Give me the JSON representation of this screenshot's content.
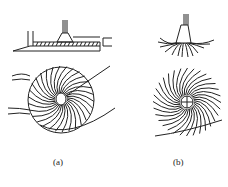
{
  "figure": {
    "panels": [
      {
        "id": "a",
        "label": "(a)",
        "description": "side view with horizontal plate and top view of disc with curved vanes and outlet"
      },
      {
        "id": "b",
        "label": "(b)",
        "description": "side view of nozzle with radiating curved jets and top view of spiral vane pattern"
      }
    ],
    "line_color": "#222222",
    "background": "#ffffff"
  }
}
